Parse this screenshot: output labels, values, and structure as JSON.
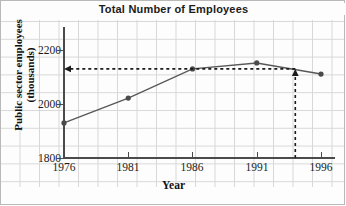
{
  "chart_data": {
    "type": "line",
    "title": "Total Number of Employees",
    "xlabel": "Year",
    "ylabel_line1": "Public sector employees",
    "ylabel_line2": "(thousands)",
    "x": [
      1976,
      1981,
      1986,
      1991,
      1996
    ],
    "values": [
      1930,
      2022,
      2130,
      2152,
      2111
    ],
    "xtick_labels": [
      "1976",
      "1981",
      "1986",
      "1991",
      "1996"
    ],
    "ytick_labels": [
      "1800",
      "2000",
      "2200"
    ],
    "ytick_values": [
      1800,
      2000,
      2200
    ],
    "xlim": [
      1976,
      1996
    ],
    "ylim": [
      1800,
      2250
    ],
    "grid": true,
    "legend": "none",
    "series_color": "#585858",
    "marker_color": "#4a4a4a",
    "grid_color": "#d8d8d8",
    "axis_color": "#4a4a4a",
    "annotations": [
      {
        "name": "vertical-guide-arrow",
        "style": "dashed-arrow",
        "from_x": 1994,
        "from_y": 1800,
        "to_x": 1994,
        "to_y": 2130,
        "direction": "up"
      },
      {
        "name": "horizontal-guide-arrow",
        "style": "dashed-arrow",
        "from_x": 1994,
        "from_y": 2130,
        "to_x": 1976,
        "to_y": 2130,
        "direction": "left"
      }
    ]
  },
  "figure": {
    "border_color": "#b9b9b9",
    "background": "#fdfdfd"
  }
}
